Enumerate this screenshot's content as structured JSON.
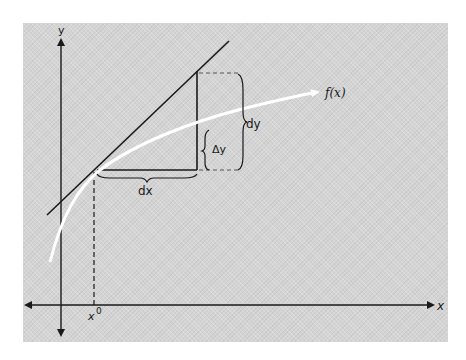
{
  "diagram": {
    "title": "",
    "colors": {
      "background": "#ffffff",
      "panel": "#d4d4d4",
      "ink": "#1a1a1a",
      "curve": "#ffffff"
    },
    "axes": {
      "x_label": "x",
      "y_label": "y"
    },
    "labels": {
      "curve": "f(x)",
      "dy": "dy",
      "delta_y": "Δy",
      "dx": "dx",
      "x0_base": "x",
      "x0_sup": "0"
    },
    "elements": [
      {
        "id": "tangent-line",
        "type": "line",
        "desc": "tangent to f(x) at x0"
      },
      {
        "id": "curve",
        "type": "curve",
        "desc": "f(x), drawn in white with arrowhead"
      },
      {
        "id": "dx-segment",
        "type": "line",
        "desc": "horizontal run from x0"
      },
      {
        "id": "rise-segment",
        "type": "line",
        "desc": "vertical rise to tangent line"
      },
      {
        "id": "dy-brace",
        "type": "brace",
        "desc": "spans full rise to tangent"
      },
      {
        "id": "delta-y-brace",
        "type": "brace",
        "desc": "spans rise to curve"
      },
      {
        "id": "dx-brace",
        "type": "brace",
        "desc": "spans horizontal run"
      },
      {
        "id": "x0-dashed",
        "type": "dashed-line",
        "desc": "drop from point to x-axis"
      }
    ]
  }
}
